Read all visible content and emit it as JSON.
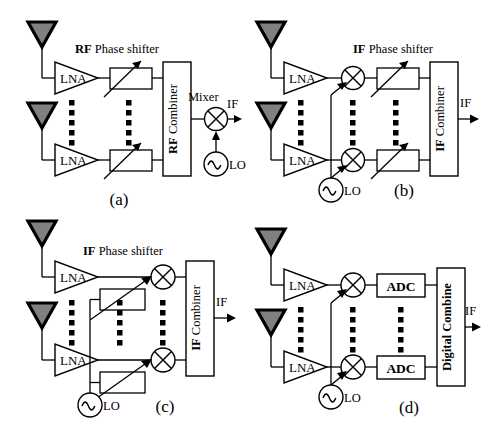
{
  "figure": {
    "type": "block-diagram",
    "background": "#ffffff",
    "stroke_color": "#000000",
    "antenna_fill": "#808080"
  },
  "panels": [
    {
      "id": "a",
      "caption": "(a)",
      "title_bold": "RF",
      "title_rest": " Phase shifter",
      "combiner_bold": "RF",
      "combiner_rest": " Combiner",
      "lna_top": "LNA",
      "lna_bottom": "LNA",
      "mixer_label": "Mixer",
      "lo_label": "LO",
      "output_label": "IF",
      "blocks": [
        "antenna",
        "antenna",
        "LNA",
        "LNA",
        "phase-shifter",
        "phase-shifter",
        "RF Combiner",
        "Mixer",
        "LO"
      ]
    },
    {
      "id": "b",
      "caption": "(b)",
      "title_bold": "IF",
      "title_rest": " Phase shifter",
      "combiner_bold": "IF",
      "combiner_rest": " Combiner",
      "lna_top": "LNA",
      "lna_bottom": "LNA",
      "lo_label": "LO",
      "output_label": "IF",
      "blocks": [
        "antenna",
        "antenna",
        "LNA",
        "LNA",
        "mixer",
        "mixer",
        "phase-shifter",
        "phase-shifter",
        "IF Combiner",
        "LO"
      ]
    },
    {
      "id": "c",
      "caption": "(c)",
      "title_bold": "IF",
      "title_rest": " Phase shifter",
      "combiner_bold": "IF",
      "combiner_rest": " Combiner",
      "lna_top": "LNA",
      "lna_bottom": "LNA",
      "lo_label": "LO",
      "output_label": "IF",
      "blocks": [
        "antenna",
        "antenna",
        "LNA",
        "LNA",
        "phase-shifter",
        "phase-shifter",
        "mixer",
        "mixer",
        "IF Combiner",
        "LO"
      ]
    },
    {
      "id": "d",
      "caption": "(d)",
      "adc_top": "ADC",
      "adc_bottom": "ADC",
      "combiner_bold": "Digital Combine",
      "combiner_rest": "",
      "lna_top": "LNA",
      "lna_bottom": "LNA",
      "lo_label": "LO",
      "output_label": "IF",
      "blocks": [
        "antenna",
        "antenna",
        "LNA",
        "LNA",
        "mixer",
        "mixer",
        "ADC",
        "ADC",
        "Digital Combine",
        "LO"
      ]
    }
  ]
}
